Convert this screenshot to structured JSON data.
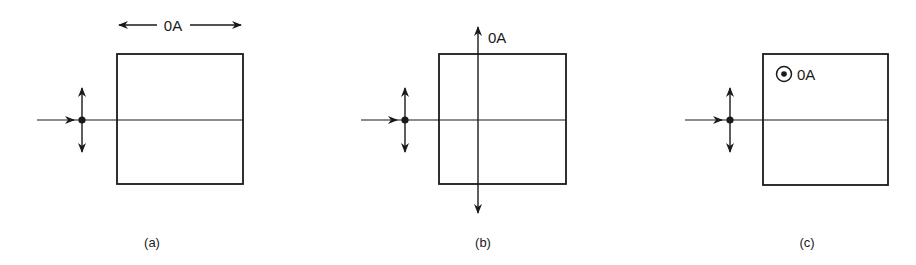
{
  "figure": {
    "panels": [
      {
        "id": "a",
        "caption": "(a)",
        "axis_label": "0A",
        "axis_orientation": "horizontal-in-plane",
        "description": "Optic axis parallel to horizontal, lying along box top edge"
      },
      {
        "id": "b",
        "caption": "(b)",
        "axis_label": "0A",
        "axis_orientation": "vertical-in-plane",
        "description": "Optic axis vertical, passing through box"
      },
      {
        "id": "c",
        "caption": "(c)",
        "axis_label": "0A",
        "axis_orientation": "out-of-plane",
        "description": "Optic axis pointing out of the page (dot-in-circle symbol)"
      }
    ],
    "common_elements": {
      "incident_beam": "arrow entering from left",
      "polarization": "vertical double-headed arrow at dot on beam",
      "crystal": "square box bisected by beam line"
    },
    "colors": {
      "stroke": "#1a1a1a",
      "background": "#ffffff"
    }
  }
}
